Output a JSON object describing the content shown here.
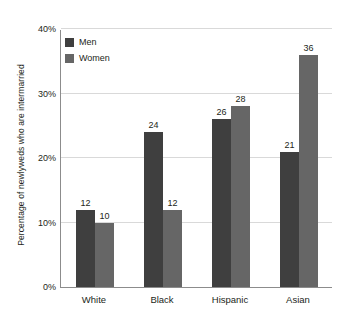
{
  "chart_data": {
    "type": "bar",
    "title": "",
    "xlabel": "",
    "ylabel": "Percentage of newlyweds who are intermarried",
    "categories": [
      "White",
      "Black",
      "Hispanic",
      "Asian"
    ],
    "series": [
      {
        "name": "Men",
        "values": [
          12,
          24,
          26,
          21
        ],
        "color": "#3f3f3f"
      },
      {
        "name": "Women",
        "values": [
          10,
          12,
          28,
          36
        ],
        "color": "#666666"
      }
    ],
    "ylim": [
      0,
      40
    ],
    "yticks": [
      0,
      10,
      20,
      30,
      40
    ],
    "ytick_labels": [
      "0%",
      "10%",
      "20%",
      "30%",
      "40%"
    ],
    "grid": true,
    "legend_position": "top-left",
    "data_labels": [
      {
        "category": "White",
        "series": "Men",
        "value": "12"
      },
      {
        "category": "White",
        "series": "Women",
        "value": "10"
      },
      {
        "category": "Black",
        "series": "Men",
        "value": "24"
      },
      {
        "category": "Black",
        "series": "Women",
        "value": "12"
      },
      {
        "category": "Hispanic",
        "series": "Men",
        "value": "26"
      },
      {
        "category": "Hispanic",
        "series": "Women",
        "value": "28"
      },
      {
        "category": "Asian",
        "series": "Men",
        "value": "21"
      },
      {
        "category": "Asian",
        "series": "Women",
        "value": "36"
      }
    ]
  },
  "axis": {
    "y_title": "Percentage of newlyweds who are intermarried",
    "axis_color": "#8c8c8c",
    "grid_color": "#d9d9d9"
  },
  "legend": {
    "items": [
      {
        "label": "Men",
        "color": "#3f3f3f"
      },
      {
        "label": "Women",
        "color": "#666666"
      }
    ]
  }
}
